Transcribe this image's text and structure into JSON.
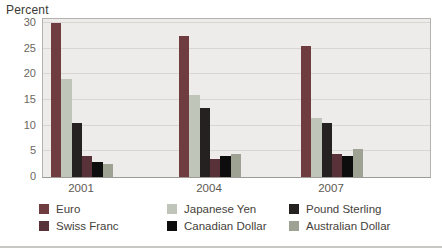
{
  "chart_data": {
    "type": "bar",
    "title": "",
    "ylabel": "Percent",
    "xlabel": "",
    "categories": [
      "2001",
      "2004",
      "2007"
    ],
    "series": [
      {
        "name": "Euro",
        "color": "#6f3d40",
        "values": [
          30,
          27.5,
          25.5
        ]
      },
      {
        "name": "Japanese Yen",
        "color": "#c0c5ba",
        "values": [
          19,
          16,
          11.5
        ]
      },
      {
        "name": "Pound Sterling",
        "color": "#252121",
        "values": [
          10.5,
          13.5,
          10.5
        ]
      },
      {
        "name": "Swiss Franc",
        "color": "#593239",
        "values": [
          4,
          3.5,
          4.5
        ]
      },
      {
        "name": "Canadian Dollar",
        "color": "#0e0d0d",
        "values": [
          3,
          4,
          4
        ]
      },
      {
        "name": "Australian Dollar",
        "color": "#9da293",
        "values": [
          2.5,
          4.5,
          5.5
        ]
      }
    ],
    "ylim": [
      0,
      30
    ],
    "yticks": [
      0,
      5,
      10,
      15,
      20,
      25,
      30
    ],
    "grid": true,
    "legend_position": "bottom",
    "plot_background": "#edecea",
    "gridline_color": "#d8d6d2"
  }
}
